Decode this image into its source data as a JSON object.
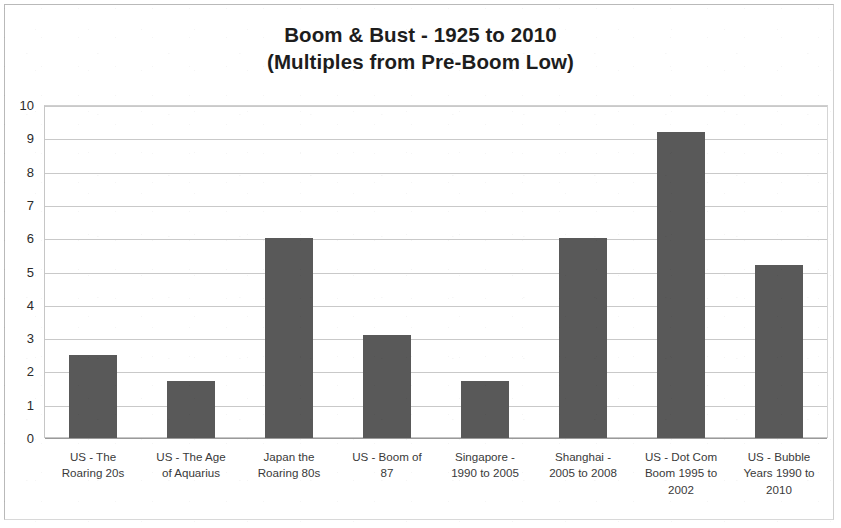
{
  "chart_data": {
    "type": "bar",
    "title": "Boom & Bust - 1925 to 2010",
    "subtitle": "(Multiples from Pre-Boom Low)",
    "xlabel": "",
    "ylabel": "",
    "ylim": [
      0,
      10
    ],
    "yticks": [
      0,
      1,
      2,
      3,
      4,
      5,
      6,
      7,
      8,
      9,
      10
    ],
    "ytick_labels": [
      "0",
      "1",
      "2",
      "3",
      "4",
      "5",
      "6",
      "7",
      "8",
      "9",
      "10"
    ],
    "grid": "horizontal",
    "legend": "none",
    "bar_color": "#595959",
    "categories": [
      "US - The Roaring 20s",
      "US - The Age of Aquarius",
      "Japan the Roaring 80s",
      "US - Boom of 87",
      "Singapore - 1990 to 2005",
      "Shanghai - 2005 to 2008",
      "US - Dot Com Boom 1995 to 2002",
      "US - Bubble Years 1990 to 2010"
    ],
    "category_label_lines": [
      [
        "US - The",
        "Roaring 20s"
      ],
      [
        "US - The Age",
        "of Aquarius"
      ],
      [
        "Japan the",
        "Roaring 80s"
      ],
      [
        "US - Boom of",
        "87"
      ],
      [
        "Singapore -",
        "1990 to 2005"
      ],
      [
        "Shanghai -",
        "2005 to 2008"
      ],
      [
        "US - Dot Com",
        "Boom 1995 to",
        "2002"
      ],
      [
        "US - Bubble",
        "Years 1990 to",
        "2010"
      ]
    ],
    "values": [
      2.5,
      1.7,
      6.0,
      3.1,
      1.7,
      6.0,
      9.2,
      5.2
    ]
  }
}
